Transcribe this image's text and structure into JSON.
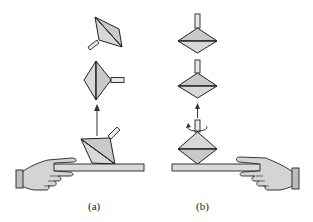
{
  "figure": {
    "panels": [
      {
        "id": "a",
        "label": "(a)",
        "description": "Non-spinning top launched from a board tumbles as it rises"
      },
      {
        "id": "b",
        "label": "(b)",
        "description": "Spinning top launched from a board keeps its axis vertical as it rises"
      }
    ],
    "colors": {
      "fill": "#c9c9c9",
      "stroke": "#222222",
      "background": "#ffffff"
    }
  }
}
